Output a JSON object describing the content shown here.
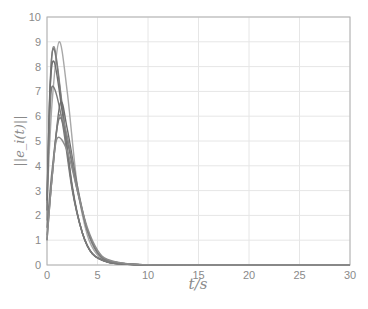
{
  "chart_data": {
    "type": "line",
    "title": "",
    "xlabel": "t/s",
    "ylabel": "||e_i(t)||",
    "xlim": [
      0,
      30
    ],
    "ylim": [
      0,
      10
    ],
    "xticks": [
      0,
      5,
      10,
      15,
      20,
      25,
      30
    ],
    "yticks": [
      0,
      1,
      2,
      3,
      4,
      5,
      6,
      7,
      8,
      9,
      10
    ],
    "grid": true,
    "legend": null,
    "series": [
      {
        "name": "agent 1",
        "color": "#a8a8a8",
        "x": [
          0,
          0.5,
          1.2,
          2,
          3,
          4,
          5,
          6,
          8,
          10,
          15,
          30
        ],
        "values": [
          2.5,
          6.5,
          9.0,
          7.0,
          3.2,
          1.2,
          0.4,
          0.15,
          0.03,
          0.01,
          0,
          0
        ]
      },
      {
        "name": "agent 2",
        "color": "#8c8c8c",
        "x": [
          0,
          0.3,
          0.7,
          1.5,
          2.5,
          3.5,
          4.5,
          6,
          8,
          10,
          15,
          30
        ],
        "values": [
          1.8,
          7.0,
          8.8,
          6.5,
          3.2,
          1.3,
          0.45,
          0.12,
          0.03,
          0.01,
          0,
          0
        ]
      },
      {
        "name": "agent 3",
        "color": "#7a7a7a",
        "x": [
          0,
          0.3,
          0.7,
          1.5,
          2.5,
          3.5,
          4.5,
          6,
          8,
          10,
          15,
          30
        ],
        "values": [
          2.2,
          7.2,
          8.7,
          6.4,
          3.1,
          1.3,
          0.45,
          0.12,
          0.03,
          0.01,
          0,
          0
        ]
      },
      {
        "name": "agent 4",
        "color": "#6e6e6e",
        "x": [
          0,
          0.3,
          0.7,
          1.5,
          2.5,
          3.5,
          4.5,
          6,
          8,
          10,
          15,
          30
        ],
        "values": [
          2.6,
          7.0,
          8.2,
          6.2,
          3.1,
          1.3,
          0.45,
          0.12,
          0.03,
          0.01,
          0,
          0
        ]
      },
      {
        "name": "agent 5",
        "color": "#7a7a7a",
        "x": [
          0,
          0.3,
          0.6,
          1.5,
          2.5,
          3.5,
          4.5,
          6,
          8,
          10,
          15,
          30
        ],
        "values": [
          2.8,
          6.2,
          7.2,
          5.8,
          3.0,
          1.3,
          0.45,
          0.12,
          0.03,
          0.01,
          0,
          0
        ]
      },
      {
        "name": "agent 6",
        "color": "#6e6e6e",
        "x": [
          0,
          0.5,
          1.3,
          2,
          3,
          4,
          5,
          6,
          8,
          10,
          15,
          30
        ],
        "values": [
          1.0,
          3.5,
          6.5,
          5.5,
          3.2,
          1.4,
          0.5,
          0.18,
          0.04,
          0.01,
          0,
          0
        ]
      },
      {
        "name": "agent 7",
        "color": "#8c8c8c",
        "x": [
          0,
          0.5,
          1.2,
          2,
          3,
          4,
          5,
          6,
          8,
          10,
          15,
          30
        ],
        "values": [
          1.2,
          3.5,
          6.0,
          5.2,
          3.1,
          1.4,
          0.5,
          0.18,
          0.04,
          0.01,
          0,
          0
        ]
      },
      {
        "name": "agent 8",
        "color": "#7a7a7a",
        "x": [
          0,
          0.5,
          1.2,
          2,
          3,
          4,
          5,
          6,
          8,
          10,
          15,
          30
        ],
        "values": [
          1.5,
          3.8,
          5.9,
          5.0,
          3.0,
          1.4,
          0.5,
          0.18,
          0.04,
          0.01,
          0,
          0
        ]
      },
      {
        "name": "agent 9",
        "color": "#8c8c8c",
        "x": [
          0,
          0.5,
          1.0,
          2,
          3,
          4,
          5,
          6,
          8,
          10,
          15,
          30
        ],
        "values": [
          1.0,
          3.5,
          5.1,
          4.6,
          3.0,
          1.5,
          0.6,
          0.22,
          0.05,
          0.01,
          0,
          0
        ]
      }
    ]
  }
}
